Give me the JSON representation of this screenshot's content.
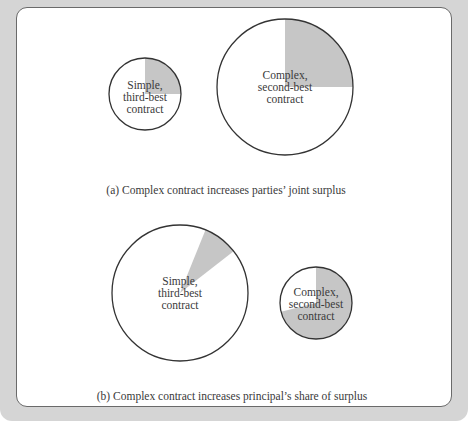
{
  "colors": {
    "frame": "#d5d5d5",
    "panel": "#ffffff",
    "slice_fill": "#c6c6c6",
    "outline": "#333333",
    "text": "#3a3a3a"
  },
  "panel_a": {
    "caption": "(a)  Complex contract increases parties’ joint surplus",
    "pies": [
      {
        "label_lines": [
          "Simple,",
          "third-best",
          "contract"
        ],
        "center": [
          145,
          94
        ],
        "radius": 36,
        "shaded_start_deg": 0,
        "shaded_end_deg": 90
      },
      {
        "label_lines": [
          "Complex,",
          "second-best",
          "contract"
        ],
        "center": [
          285,
          87
        ],
        "radius": 68,
        "shaded_start_deg": 0,
        "shaded_end_deg": 90
      }
    ]
  },
  "panel_b": {
    "caption": "(b)  Complex contract increases principal’s share of surplus",
    "pies": [
      {
        "label_lines": [
          "Simple,",
          "third-best",
          "contract"
        ],
        "center": [
          180,
          293
        ],
        "radius": 68,
        "shaded_start_deg": 22,
        "shaded_end_deg": 52
      },
      {
        "label_lines": [
          "Complex,",
          "second-best",
          "contract"
        ],
        "center": [
          316,
          303
        ],
        "radius": 36,
        "shaded_start_deg": 0,
        "shaded_end_deg": 256
      }
    ]
  }
}
